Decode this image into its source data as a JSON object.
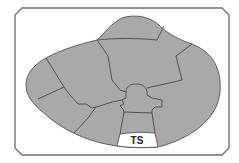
{
  "diagram": {
    "type": "segmented-region-map",
    "colors": {
      "background": "#ffffff",
      "frame_stroke": "#6e6e6e",
      "region_fill": "#a9a9a9",
      "region_border": "#4a4a4a",
      "highlight_fill": "#ffffff"
    },
    "regions": [
      {
        "id": "top-cap"
      },
      {
        "id": "upper-left"
      },
      {
        "id": "far-left"
      },
      {
        "id": "lower-left"
      },
      {
        "id": "lower-middle-left"
      },
      {
        "id": "center-upper"
      },
      {
        "id": "right-upper"
      },
      {
        "id": "right-large"
      },
      {
        "id": "central-hub"
      },
      {
        "id": "central-stem"
      },
      {
        "id": "ts-region",
        "label": "TS",
        "highlighted": true
      }
    ],
    "labels": {
      "ts": "TS"
    }
  }
}
